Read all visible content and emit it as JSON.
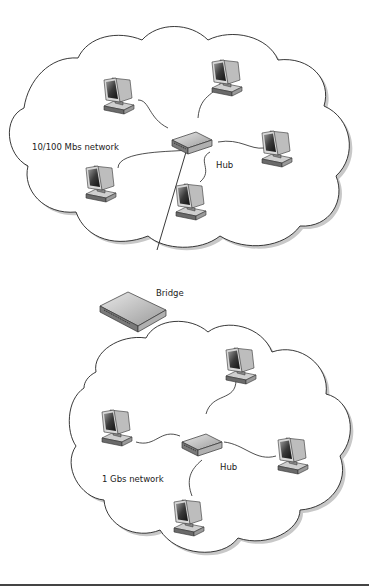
{
  "diagram": {
    "type": "network-topology",
    "networks": [
      {
        "id": "net-top",
        "label": "10/100 Mbs network",
        "hub_label": "Hub",
        "computers": 5
      },
      {
        "id": "net-bottom",
        "label": "1 Gbs network",
        "hub_label": "Hub",
        "computers": 4
      }
    ],
    "bridge_label": "Bridge",
    "connections": [
      [
        "net-top.hub",
        "bridge"
      ],
      [
        "bridge",
        "net-bottom.hub"
      ]
    ]
  },
  "labels": {
    "top_network": "10/100 Mbs network",
    "top_hub": "Hub",
    "bridge": "Bridge",
    "bottom_network": "1 Gbs network",
    "bottom_hub": "Hub"
  }
}
